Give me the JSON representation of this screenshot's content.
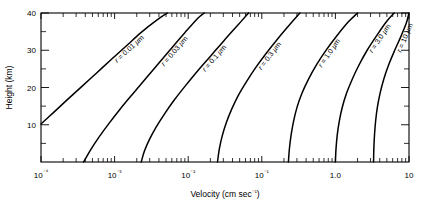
{
  "chart_data": {
    "type": "line",
    "title": "",
    "xlabel": "Velocity (cm sec⁻¹)",
    "ylabel": "Height (km)",
    "xscale": "log",
    "yscale": "linear",
    "xlim": [
      0.0001,
      10
    ],
    "ylim": [
      0,
      40
    ],
    "grid": false,
    "legend": "inline-curve-labels",
    "x_tick_labels": [
      "10⁻⁴",
      "10⁻³",
      "10⁻²",
      "10⁻¹",
      "1.0",
      "10"
    ],
    "x_tick_values": [
      0.0001,
      0.001,
      0.01,
      0.1,
      1.0,
      10
    ],
    "x_minor_ticks_per_decade": [
      2,
      3,
      4,
      5,
      6,
      7,
      8,
      9
    ],
    "y_tick_labels": [
      "10",
      "20",
      "30",
      "40"
    ],
    "y_tick_values": [
      10,
      20,
      30,
      40
    ],
    "y_minor_tick_values": [
      5,
      15,
      25,
      35
    ],
    "series": [
      {
        "name": "r = 0.01 µm",
        "radius_um": 0.01,
        "label": "r = 0.01 µm",
        "points": [
          [
            0.0001,
            10.2
          ],
          [
            0.00015,
            13.4
          ],
          [
            0.00023,
            16.8
          ],
          [
            0.00036,
            20.3
          ],
          [
            0.00057,
            23.9
          ],
          [
            0.0009,
            27.5
          ],
          [
            0.00145,
            31.2
          ],
          [
            0.0023,
            34.8
          ],
          [
            0.0037,
            38.0
          ],
          [
            0.0052,
            40.0
          ]
        ]
      },
      {
        "name": "r = 0.03 µm",
        "radius_um": 0.03,
        "label": "r = 0.03 µm",
        "points": [
          [
            0.00038,
            0.0
          ],
          [
            0.00047,
            3.2
          ],
          [
            0.00062,
            6.8
          ],
          [
            0.00085,
            10.5
          ],
          [
            0.0012,
            14.3
          ],
          [
            0.00175,
            18.2
          ],
          [
            0.0026,
            22.2
          ],
          [
            0.0039,
            26.3
          ],
          [
            0.0059,
            30.5
          ],
          [
            0.009,
            34.7
          ],
          [
            0.0135,
            38.6
          ],
          [
            0.0165,
            40.0
          ]
        ]
      },
      {
        "name": "r = 0.1 µm",
        "radius_um": 0.1,
        "label": "r = 0.1 µm",
        "points": [
          [
            0.0023,
            0.0
          ],
          [
            0.00255,
            3.0
          ],
          [
            0.003,
            6.2
          ],
          [
            0.0037,
            9.5
          ],
          [
            0.0048,
            13.0
          ],
          [
            0.0065,
            16.7
          ],
          [
            0.0092,
            20.5
          ],
          [
            0.0135,
            24.5
          ],
          [
            0.0205,
            28.6
          ],
          [
            0.031,
            32.7
          ],
          [
            0.047,
            36.7
          ],
          [
            0.066,
            40.0
          ]
        ]
      },
      {
        "name": "r = 0.3 µm",
        "radius_um": 0.3,
        "label": "r = 0.3 µm",
        "points": [
          [
            0.025,
            0.0
          ],
          [
            0.0265,
            3.5
          ],
          [
            0.029,
            7.0
          ],
          [
            0.033,
            10.6
          ],
          [
            0.039,
            14.2
          ],
          [
            0.048,
            17.9
          ],
          [
            0.062,
            21.6
          ],
          [
            0.083,
            25.4
          ],
          [
            0.115,
            29.2
          ],
          [
            0.165,
            33.1
          ],
          [
            0.24,
            36.9
          ],
          [
            0.33,
            40.0
          ]
        ]
      },
      {
        "name": "r = 1.0 µm",
        "radius_um": 1.0,
        "label": "r = 1.0 µm",
        "points": [
          [
            0.23,
            0.0
          ],
          [
            0.237,
            3.5
          ],
          [
            0.25,
            7.2
          ],
          [
            0.27,
            10.9
          ],
          [
            0.3,
            14.6
          ],
          [
            0.35,
            18.4
          ],
          [
            0.43,
            22.2
          ],
          [
            0.55,
            26.0
          ],
          [
            0.74,
            29.9
          ],
          [
            1.03,
            33.7
          ],
          [
            1.48,
            37.5
          ],
          [
            2.0,
            40.0
          ]
        ]
      },
      {
        "name": "r = 3.0 µm",
        "radius_um": 3.0,
        "label": "r = 3.0 µm",
        "points": [
          [
            1.0,
            0.0
          ],
          [
            1.02,
            3.6
          ],
          [
            1.06,
            7.3
          ],
          [
            1.13,
            11.0
          ],
          [
            1.24,
            14.7
          ],
          [
            1.42,
            18.5
          ],
          [
            1.7,
            22.3
          ],
          [
            2.1,
            26.1
          ],
          [
            2.7,
            30.0
          ],
          [
            3.6,
            33.8
          ],
          [
            4.9,
            37.6
          ],
          [
            6.3,
            40.0
          ]
        ]
      },
      {
        "name": "r = 10 µm",
        "radius_um": 10.0,
        "label": "r = 10 µm",
        "points": [
          [
            3.3,
            0.0
          ],
          [
            3.33,
            3.6
          ],
          [
            3.4,
            7.3
          ],
          [
            3.52,
            11.0
          ],
          [
            3.72,
            14.7
          ],
          [
            4.05,
            18.5
          ],
          [
            4.55,
            22.3
          ],
          [
            5.3,
            26.1
          ],
          [
            6.4,
            30.0
          ],
          [
            7.8,
            33.8
          ],
          [
            9.2,
            37.3
          ],
          [
            10.0,
            40.0
          ]
        ]
      }
    ]
  },
  "figure": {
    "background_color": "#ffffff",
    "line_color": "#000000",
    "axis_color": "#000000"
  }
}
